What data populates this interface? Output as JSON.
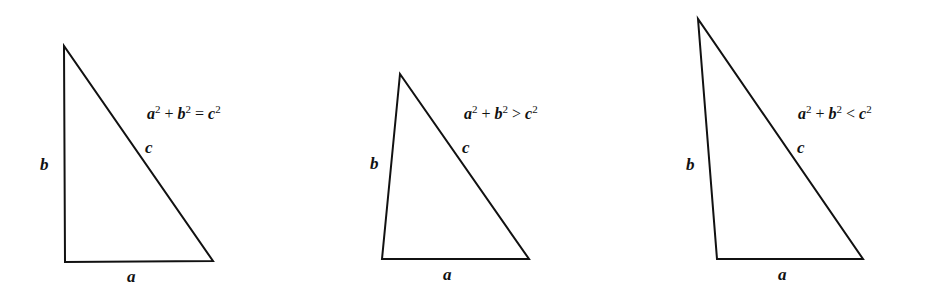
{
  "diagrams": [
    {
      "name": "right-triangle",
      "points": "64,46 65,262 213,261",
      "labels": {
        "a": "a",
        "b": "b",
        "c": "c"
      },
      "equation": {
        "lhs_a": "a",
        "lhs_b": "b",
        "plus": " + ",
        "relation": " = ",
        "rhs_c": "c",
        "exp": "2"
      }
    },
    {
      "name": "acute-triangle",
      "points": "400,74 382,259 529,259",
      "labels": {
        "a": "a",
        "b": "b",
        "c": "c"
      },
      "equation": {
        "lhs_a": "a",
        "lhs_b": "b",
        "plus": " + ",
        "relation": " > ",
        "rhs_c": "c",
        "exp": "2"
      }
    },
    {
      "name": "obtuse-triangle",
      "points": "698,19 717,259 863,259",
      "labels": {
        "a": "a",
        "b": "b",
        "c": "c"
      },
      "equation": {
        "lhs_a": "a",
        "lhs_b": "b",
        "plus": " + ",
        "relation": " < ",
        "rhs_c": "c",
        "exp": "2"
      }
    }
  ],
  "stroke_color": "#111111"
}
